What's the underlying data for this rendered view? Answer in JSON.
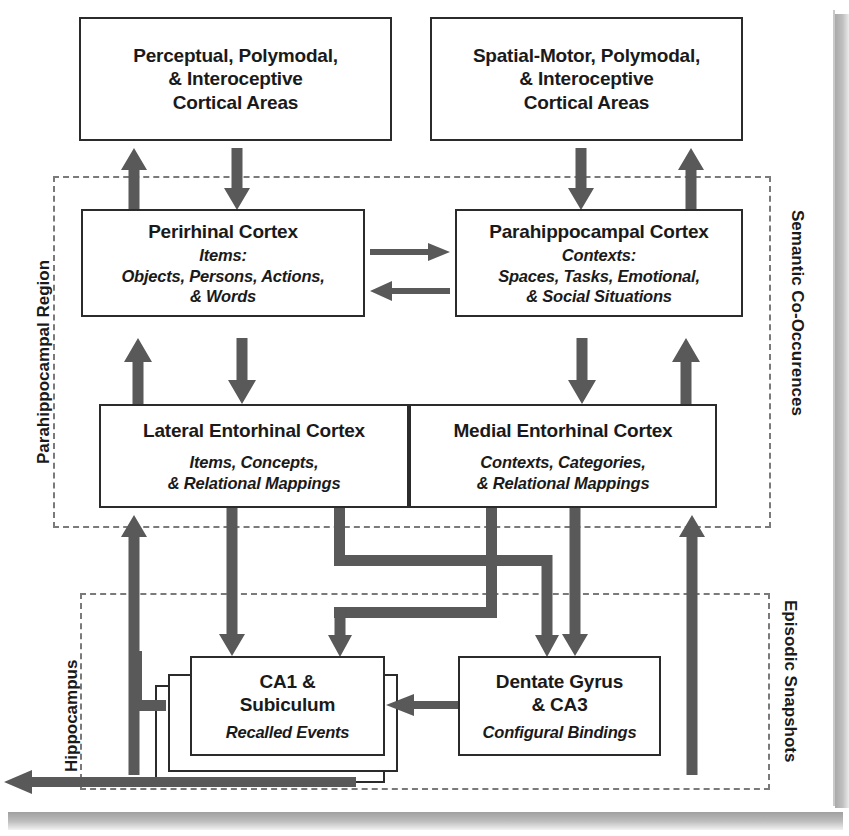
{
  "figure": {
    "accent_color": "#595959",
    "box_border_color": "#2b2b2b",
    "region_border_color": "#7a7a7a"
  },
  "regions": {
    "parahippocampal": {
      "label": "Parahippocampal Region"
    },
    "hippocampus": {
      "label": "Hippocampus"
    },
    "semantic": {
      "label": "Semantic Co-Occurences"
    },
    "episodic": {
      "label": "Episodic Snapshots"
    }
  },
  "boxes": {
    "perceptual_cortex": {
      "line1": "Perceptual, Polymodal,",
      "line2": "& Interoceptive",
      "line3": "Cortical Areas"
    },
    "spatial_motor_cortex": {
      "line1": "Spatial-Motor, Polymodal,",
      "line2": "& Interoceptive",
      "line3": "Cortical Areas"
    },
    "perirhinal_cortex": {
      "title": "Perirhinal Cortex",
      "sub1": "Items:",
      "sub2": "Objects, Persons, Actions,",
      "sub3": "& Words"
    },
    "parahippocampal_cortex": {
      "title": "Parahippocampal Cortex",
      "sub1": "Contexts:",
      "sub2": "Spaces, Tasks, Emotional,",
      "sub3": "& Social Situations"
    },
    "lateral_entorhinal": {
      "title": "Lateral Entorhinal Cortex",
      "sub1": "Items, Concepts,",
      "sub2": "& Relational Mappings"
    },
    "medial_entorhinal": {
      "title": "Medial Entorhinal Cortex",
      "sub1": "Contexts, Categories,",
      "sub2": "& Relational Mappings"
    },
    "ca1_subiculum": {
      "title1": "CA1 &",
      "title2": "Subiculum",
      "sub1": "Recalled Events"
    },
    "dentate_ca3": {
      "title1": "Dentate Gyrus",
      "title2": "& CA3",
      "sub1": "Configural Bindings"
    }
  }
}
